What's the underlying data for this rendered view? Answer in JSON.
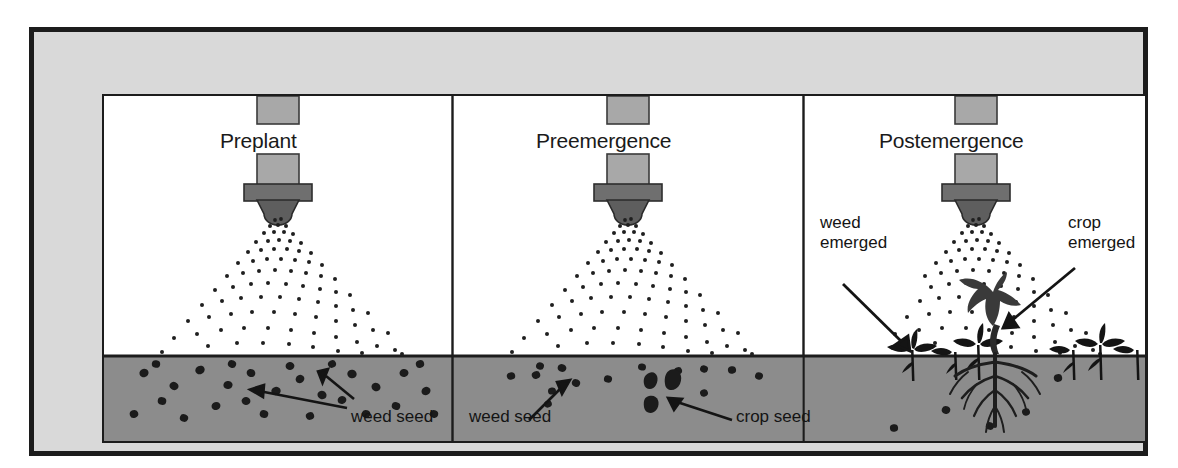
{
  "figure": {
    "name": "herbicide-application-timing",
    "frame": {
      "outer_border_color": "#1c1c1c",
      "mat_color": "#d9d9d9",
      "stage_background": "#ffffff",
      "soil_color": "#8c8c8c",
      "ink_color": "#1a1a1a",
      "nozzle_shaft_color": "#a8a8a8",
      "nozzle_collar_color": "#6f6f6f",
      "nozzle_tip_color": "#5e5e5e"
    }
  },
  "panels": [
    {
      "id": "preplant",
      "title": "Preplant",
      "callouts": [
        {
          "id": "weed-seed",
          "text": "weed seed",
          "arrows": 2
        }
      ],
      "soil_contents": [
        "many weed seeds"
      ],
      "emerged_plants": []
    },
    {
      "id": "preemergence",
      "title": "Preemergence",
      "callouts": [
        {
          "id": "weed-seed",
          "text": "weed seed",
          "arrows": 1
        },
        {
          "id": "crop-seed",
          "text": "crop seed",
          "arrows": 1
        }
      ],
      "soil_contents": [
        "weed seeds",
        "crop seeds"
      ],
      "emerged_plants": []
    },
    {
      "id": "postemergence",
      "title": "Postemergence",
      "callouts": [
        {
          "id": "weed-emerged",
          "text": "weed\nemerged",
          "line1": "weed",
          "line2": "emerged",
          "arrows": 1
        },
        {
          "id": "crop-emerged",
          "text": "crop\nemerged",
          "line1": "crop",
          "line2": "emerged",
          "arrows": 1
        }
      ],
      "soil_contents": [
        "few weed seeds"
      ],
      "emerged_plants": [
        "weed seedlings",
        "crop seedling with roots"
      ]
    }
  ],
  "icons": {
    "spray_nozzle": "spray-nozzle-icon",
    "spray_droplets": "spray-droplets-icon",
    "weed_seed": "weed-seed-icon",
    "crop_seed": "crop-seed-icon",
    "weed_seedling": "weed-seedling-icon",
    "crop_seedling": "crop-seedling-icon",
    "arrow": "arrow-icon"
  }
}
